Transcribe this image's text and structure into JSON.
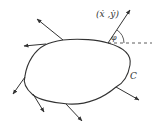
{
  "diagram": {
    "labels": {
      "velocity": "(ẋ ,ẏ)",
      "angle": "φ",
      "curve": "C"
    },
    "colors": {
      "stroke": "#333333",
      "background": "#ffffff"
    }
  }
}
